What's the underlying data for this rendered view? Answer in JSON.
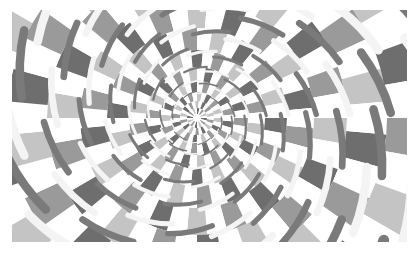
{
  "image": {
    "subject": "Fraser spiral illusion",
    "description": "Concentric rings of grey and white checkered wedges overlaid with twisted-cord arcs that appear to spiral inward",
    "frame": {
      "x": 12,
      "y": 10,
      "width": 395,
      "height": 232
    },
    "center": {
      "x": 197,
      "y": 118
    },
    "colors": {
      "background": "#ffffff",
      "dark_grey": "#6e6e6e",
      "mid_grey": "#9a9a9a",
      "light_grey": "#c4c4c4",
      "white": "#ffffff",
      "cord_light": "#f4f4f4",
      "cord_dark": "#7a7a7a"
    },
    "rings": [
      {
        "r_inner": 4,
        "r_outer": 10,
        "segments": 24
      },
      {
        "r_inner": 10,
        "r_outer": 17,
        "segments": 28
      },
      {
        "r_inner": 17,
        "r_outer": 26,
        "segments": 32
      },
      {
        "r_inner": 26,
        "r_outer": 37,
        "segments": 34
      },
      {
        "r_inner": 37,
        "r_outer": 51,
        "segments": 36
      },
      {
        "r_inner": 51,
        "r_outer": 68,
        "segments": 36
      },
      {
        "r_inner": 68,
        "r_outer": 90,
        "segments": 36
      },
      {
        "r_inner": 90,
        "r_outer": 117,
        "segments": 36
      },
      {
        "r_inner": 117,
        "r_outer": 150,
        "segments": 36
      },
      {
        "r_inner": 150,
        "r_outer": 190,
        "segments": 36
      },
      {
        "r_inner": 190,
        "r_outer": 240,
        "segments": 36
      },
      {
        "r_inner": 240,
        "r_outer": 300,
        "segments": 36
      }
    ],
    "cord_tilt_deg": 14,
    "cords_per_ring": 10
  }
}
